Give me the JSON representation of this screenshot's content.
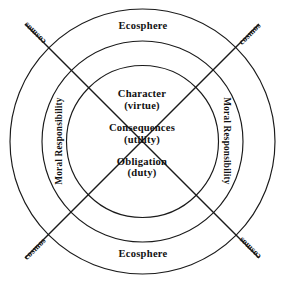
{
  "diagram": {
    "background_color": "#ffffff",
    "stroke_color": "#1a1a1a",
    "rings": {
      "outer": {
        "label_top": "Ecosphere",
        "label_bottom": "Ecosphere",
        "radius": 133
      },
      "middle": {
        "label_left": "Moral Responsibility",
        "label_right": "Moral Responsibility",
        "radius": 100
      },
      "inner": {
        "radius": 76
      }
    },
    "axes": {
      "label_top_left": "cosmos",
      "label_top_right": "cosmos",
      "label_bottom_left": "cosmos",
      "label_bottom_right": "cosmos"
    },
    "core": [
      {
        "term": "Character",
        "paren": "(virtue)"
      },
      {
        "term": "Consequences",
        "paren": "(utility)"
      },
      {
        "term": "Obligation",
        "paren": "(duty)"
      }
    ]
  }
}
